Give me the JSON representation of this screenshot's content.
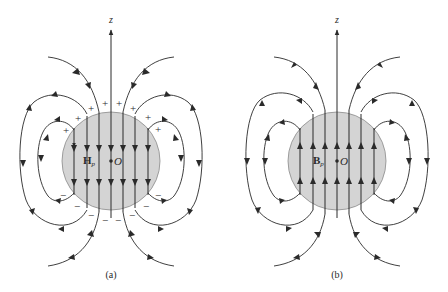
{
  "figure": {
    "panels": [
      {
        "id": "a",
        "caption": "(a)",
        "axis_label": "z",
        "field_symbol": "H",
        "field_subscript": "p",
        "origin_label": "O",
        "interior_direction": "down",
        "surface_charges": {
          "top": "+",
          "bottom": "−"
        }
      },
      {
        "id": "b",
        "caption": "(b)",
        "axis_label": "z",
        "field_symbol": "B",
        "field_subscript": "p",
        "origin_label": "O",
        "interior_direction": "up"
      }
    ],
    "colors": {
      "sphere_fill": "#d4d4d4",
      "line": "#2a2a2a",
      "charge": "#777777"
    }
  }
}
